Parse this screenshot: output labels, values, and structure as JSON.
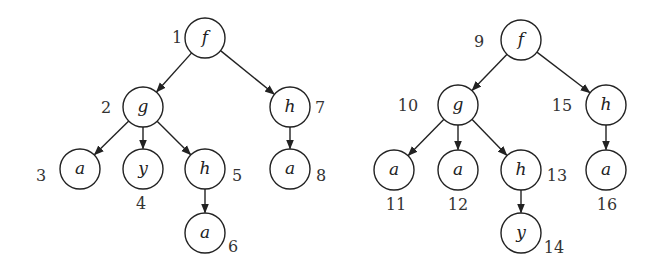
{
  "chart_data": {
    "type": "diagram",
    "title": "",
    "trees": [
      {
        "name": "left-tree",
        "nodes": [
          {
            "id": 1,
            "label": "f",
            "x": 205,
            "y": 38,
            "num_x": 177,
            "num_y": 43,
            "anchor": "middle"
          },
          {
            "id": 2,
            "label": "g",
            "x": 143,
            "y": 107,
            "num_x": 106,
            "num_y": 113,
            "anchor": "middle"
          },
          {
            "id": 7,
            "label": "h",
            "x": 290,
            "y": 107,
            "num_x": 320,
            "num_y": 113,
            "anchor": "middle"
          },
          {
            "id": 3,
            "label": "a",
            "x": 80,
            "y": 169,
            "num_x": 41,
            "num_y": 181,
            "anchor": "middle"
          },
          {
            "id": 4,
            "label": "y",
            "x": 143,
            "y": 169,
            "num_x": 141,
            "num_y": 209,
            "anchor": "middle"
          },
          {
            "id": 5,
            "label": "h",
            "x": 205,
            "y": 169,
            "num_x": 237,
            "num_y": 181,
            "anchor": "middle"
          },
          {
            "id": 8,
            "label": "a",
            "x": 290,
            "y": 169,
            "num_x": 321,
            "num_y": 181,
            "anchor": "middle"
          },
          {
            "id": 6,
            "label": "a",
            "x": 205,
            "y": 233,
            "num_x": 233,
            "num_y": 252,
            "anchor": "middle"
          }
        ],
        "edges": [
          [
            1,
            2
          ],
          [
            1,
            7
          ],
          [
            2,
            3
          ],
          [
            2,
            4
          ],
          [
            2,
            5
          ],
          [
            5,
            6
          ],
          [
            7,
            8
          ]
        ]
      },
      {
        "name": "right-tree",
        "nodes": [
          {
            "id": 9,
            "label": "f",
            "x": 521,
            "y": 40,
            "num_x": 479,
            "num_y": 47,
            "anchor": "middle"
          },
          {
            "id": 10,
            "label": "g",
            "x": 458,
            "y": 105,
            "num_x": 408,
            "num_y": 111,
            "anchor": "middle"
          },
          {
            "id": 15,
            "label": "h",
            "x": 606,
            "y": 105,
            "num_x": 562,
            "num_y": 111,
            "anchor": "middle"
          },
          {
            "id": 11,
            "label": "a",
            "x": 394,
            "y": 170,
            "num_x": 396,
            "num_y": 210,
            "anchor": "middle"
          },
          {
            "id": 12,
            "label": "a",
            "x": 458,
            "y": 170,
            "num_x": 458,
            "num_y": 210,
            "anchor": "middle"
          },
          {
            "id": 13,
            "label": "h",
            "x": 521,
            "y": 170,
            "num_x": 557,
            "num_y": 181,
            "anchor": "middle"
          },
          {
            "id": 16,
            "label": "a",
            "x": 606,
            "y": 170,
            "num_x": 607,
            "num_y": 210,
            "anchor": "middle"
          },
          {
            "id": 14,
            "label": "y",
            "x": 521,
            "y": 233,
            "num_x": 554,
            "num_y": 253,
            "anchor": "middle"
          }
        ],
        "edges": [
          [
            9,
            10
          ],
          [
            9,
            15
          ],
          [
            10,
            11
          ],
          [
            10,
            12
          ],
          [
            10,
            13
          ],
          [
            13,
            14
          ],
          [
            15,
            16
          ]
        ]
      }
    ],
    "node_radius": 20
  }
}
